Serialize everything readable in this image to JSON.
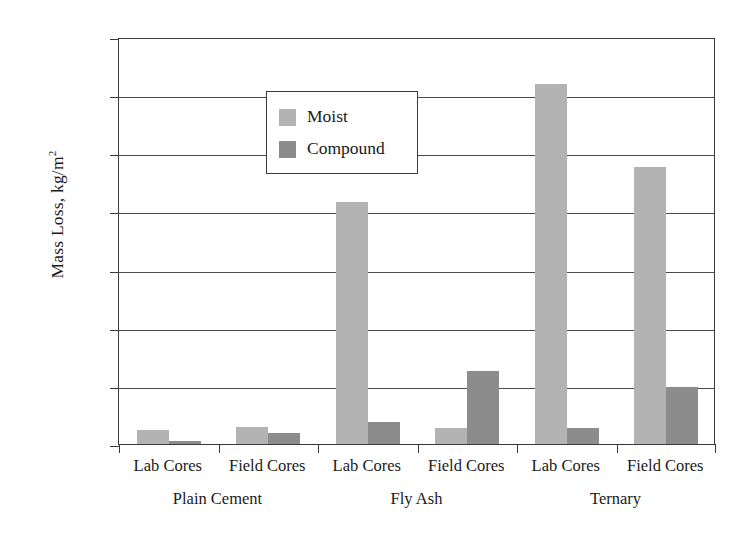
{
  "chart_data": {
    "type": "bar",
    "title": "",
    "xlabel": "",
    "ylabel": "Mass Loss, kg/m2",
    "ylabel_base": "Mass Loss, kg/m",
    "ylabel_exponent": "2",
    "ylim": [
      0.0,
      3.5
    ],
    "yticks": [
      "0.0",
      "0.5",
      "1.0",
      "1.5",
      "2.0",
      "2.5",
      "3.0",
      "3.5"
    ],
    "ytick_values": [
      0.0,
      0.5,
      1.0,
      1.5,
      2.0,
      2.5,
      3.0,
      3.5
    ],
    "grid": "horizontal",
    "legend_position": "upper-left-inside",
    "categories": [
      "Lab Cores",
      "Field Cores",
      "Lab Cores",
      "Field Cores",
      "Lab Cores",
      "Field Cores"
    ],
    "groups": [
      {
        "label": "Plain Cement",
        "categories": [
          "Lab Cores",
          "Field Cores"
        ]
      },
      {
        "label": "Fly Ash",
        "categories": [
          "Lab Cores",
          "Field Cores"
        ]
      },
      {
        "label": "Ternary",
        "categories": [
          "Lab Cores",
          "Field Cores"
        ]
      }
    ],
    "series": [
      {
        "name": "Moist",
        "color": "#b3b3b3",
        "values": [
          0.12,
          0.145,
          2.08,
          0.14,
          3.1,
          2.38
        ]
      },
      {
        "name": "Compound",
        "color": "#8c8c8c",
        "values": [
          0.03,
          0.095,
          0.19,
          0.63,
          0.14,
          0.49
        ]
      }
    ]
  },
  "legend": {
    "items": [
      {
        "label": "Moist",
        "swatch": "moist"
      },
      {
        "label": "Compound",
        "swatch": "compound"
      }
    ]
  },
  "colors": {
    "moist": "#b3b3b3",
    "compound": "#8c8c8c",
    "axis": "#3a3a3a",
    "grid": "#4a4a4a",
    "background": "#ffffff"
  }
}
